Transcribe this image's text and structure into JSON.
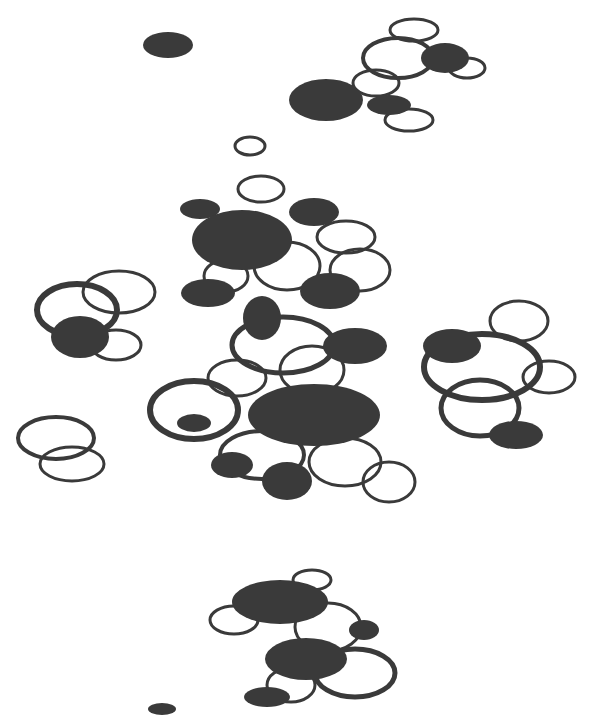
{
  "image": {
    "width": 601,
    "height": 720,
    "background": "#ffffff",
    "ink": "#3a3a3a",
    "description": "Abstract pattern of dark filled ellipses and outlined ellipse rings clustered together"
  },
  "rings": [
    {
      "cx": 414,
      "cy": 30,
      "rx": 24,
      "ry": 11,
      "w": 3
    },
    {
      "cx": 398,
      "cy": 58,
      "rx": 35,
      "ry": 20,
      "w": 4
    },
    {
      "cx": 467,
      "cy": 68,
      "rx": 18,
      "ry": 10,
      "w": 3
    },
    {
      "cx": 376,
      "cy": 83,
      "rx": 23,
      "ry": 13,
      "w": 3
    },
    {
      "cx": 409,
      "cy": 120,
      "rx": 24,
      "ry": 11,
      "w": 3
    },
    {
      "cx": 250,
      "cy": 146,
      "rx": 15,
      "ry": 9,
      "w": 3
    },
    {
      "cx": 261,
      "cy": 189,
      "rx": 23,
      "ry": 13,
      "w": 3
    },
    {
      "cx": 346,
      "cy": 237,
      "rx": 29,
      "ry": 16,
      "w": 3
    },
    {
      "cx": 360,
      "cy": 270,
      "rx": 30,
      "ry": 21,
      "w": 3
    },
    {
      "cx": 287,
      "cy": 266,
      "rx": 33,
      "ry": 24,
      "w": 3
    },
    {
      "cx": 226,
      "cy": 276,
      "rx": 22,
      "ry": 16,
      "w": 3
    },
    {
      "cx": 77,
      "cy": 310,
      "rx": 40,
      "ry": 26,
      "w": 6
    },
    {
      "cx": 119,
      "cy": 292,
      "rx": 36,
      "ry": 21,
      "w": 3
    },
    {
      "cx": 116,
      "cy": 345,
      "rx": 25,
      "ry": 15,
      "w": 3
    },
    {
      "cx": 283,
      "cy": 345,
      "rx": 51,
      "ry": 28,
      "w": 5
    },
    {
      "cx": 237,
      "cy": 378,
      "rx": 29,
      "ry": 18,
      "w": 3
    },
    {
      "cx": 312,
      "cy": 370,
      "rx": 32,
      "ry": 24,
      "w": 3
    },
    {
      "cx": 194,
      "cy": 410,
      "rx": 44,
      "ry": 29,
      "w": 6
    },
    {
      "cx": 262,
      "cy": 455,
      "rx": 42,
      "ry": 24,
      "w": 4
    },
    {
      "cx": 345,
      "cy": 462,
      "rx": 36,
      "ry": 24,
      "w": 3
    },
    {
      "cx": 389,
      "cy": 482,
      "rx": 26,
      "ry": 20,
      "w": 3
    },
    {
      "cx": 519,
      "cy": 321,
      "rx": 29,
      "ry": 20,
      "w": 3
    },
    {
      "cx": 482,
      "cy": 367,
      "rx": 58,
      "ry": 33,
      "w": 6
    },
    {
      "cx": 549,
      "cy": 377,
      "rx": 26,
      "ry": 16,
      "w": 3
    },
    {
      "cx": 480,
      "cy": 408,
      "rx": 39,
      "ry": 28,
      "w": 5
    },
    {
      "cx": 56,
      "cy": 438,
      "rx": 38,
      "ry": 21,
      "w": 4
    },
    {
      "cx": 72,
      "cy": 464,
      "rx": 32,
      "ry": 17,
      "w": 3
    },
    {
      "cx": 312,
      "cy": 580,
      "rx": 19,
      "ry": 10,
      "w": 3
    },
    {
      "cx": 234,
      "cy": 620,
      "rx": 24,
      "ry": 14,
      "w": 3
    },
    {
      "cx": 328,
      "cy": 627,
      "rx": 33,
      "ry": 24,
      "w": 3
    },
    {
      "cx": 355,
      "cy": 673,
      "rx": 40,
      "ry": 24,
      "w": 5
    },
    {
      "cx": 291,
      "cy": 685,
      "rx": 24,
      "ry": 17,
      "w": 3
    }
  ],
  "dots": [
    {
      "cx": 168,
      "cy": 45,
      "rx": 25,
      "ry": 13
    },
    {
      "cx": 326,
      "cy": 100,
      "rx": 37,
      "ry": 21
    },
    {
      "cx": 445,
      "cy": 58,
      "rx": 24,
      "ry": 15
    },
    {
      "cx": 389,
      "cy": 105,
      "rx": 22,
      "ry": 10
    },
    {
      "cx": 200,
      "cy": 209,
      "rx": 20,
      "ry": 10
    },
    {
      "cx": 242,
      "cy": 240,
      "rx": 50,
      "ry": 30
    },
    {
      "cx": 314,
      "cy": 212,
      "rx": 25,
      "ry": 14
    },
    {
      "cx": 208,
      "cy": 293,
      "rx": 27,
      "ry": 14
    },
    {
      "cx": 330,
      "cy": 291,
      "rx": 30,
      "ry": 18
    },
    {
      "cx": 262,
      "cy": 318,
      "rx": 19,
      "ry": 22
    },
    {
      "cx": 355,
      "cy": 346,
      "rx": 32,
      "ry": 18
    },
    {
      "cx": 80,
      "cy": 337,
      "rx": 29,
      "ry": 21
    },
    {
      "cx": 194,
      "cy": 423,
      "rx": 17,
      "ry": 9
    },
    {
      "cx": 314,
      "cy": 415,
      "rx": 66,
      "ry": 31
    },
    {
      "cx": 232,
      "cy": 465,
      "rx": 21,
      "ry": 13
    },
    {
      "cx": 287,
      "cy": 481,
      "rx": 25,
      "ry": 19
    },
    {
      "cx": 452,
      "cy": 346,
      "rx": 29,
      "ry": 17
    },
    {
      "cx": 516,
      "cy": 435,
      "rx": 27,
      "ry": 14
    },
    {
      "cx": 280,
      "cy": 602,
      "rx": 48,
      "ry": 22
    },
    {
      "cx": 364,
      "cy": 630,
      "rx": 15,
      "ry": 10
    },
    {
      "cx": 306,
      "cy": 659,
      "rx": 41,
      "ry": 21
    },
    {
      "cx": 267,
      "cy": 697,
      "rx": 23,
      "ry": 10
    },
    {
      "cx": 162,
      "cy": 709,
      "rx": 14,
      "ry": 6
    }
  ]
}
